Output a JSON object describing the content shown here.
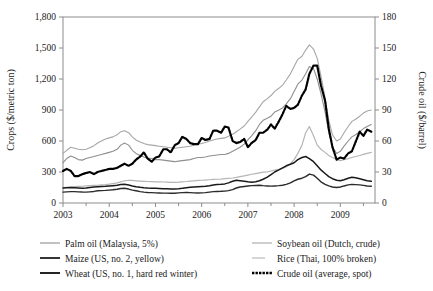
{
  "chart_data": {
    "type": "line",
    "title": "",
    "xlabel": "",
    "ylabel": "Crops ($/metric ton)",
    "y2label": "Crude oil ($/barrel)",
    "xlim": [
      2003.0,
      2009.75
    ],
    "ylim": [
      0,
      1800
    ],
    "y2lim": [
      0,
      180
    ],
    "grid": false,
    "legend_position": "bottom",
    "x_ticks": [
      2003,
      2004,
      2005,
      2006,
      2007,
      2008,
      2009
    ],
    "x_tick_labels": [
      "2003",
      "2004",
      "2005",
      "2006",
      "2007",
      "2008",
      "2009"
    ],
    "x_minor_ticks": [
      2003.5,
      2004.5,
      2005.5,
      2006.5,
      2007.5,
      2008.5,
      2009.5
    ],
    "y_ticks": [
      0,
      300,
      600,
      900,
      1200,
      1500,
      1800
    ],
    "y_tick_labels": [
      "0",
      "300",
      "600",
      "900",
      "1,200",
      "1,500",
      "1,800"
    ],
    "y2_ticks": [
      0,
      30,
      60,
      90,
      120,
      150,
      180
    ],
    "y2_tick_labels": [
      "0",
      "30",
      "60",
      "90",
      "120",
      "150",
      "180"
    ],
    "x": [
      2003.0,
      2003.08,
      2003.17,
      2003.25,
      2003.33,
      2003.42,
      2003.5,
      2003.58,
      2003.67,
      2003.75,
      2003.83,
      2003.92,
      2004.0,
      2004.08,
      2004.17,
      2004.25,
      2004.33,
      2004.42,
      2004.5,
      2004.58,
      2004.67,
      2004.75,
      2004.83,
      2004.92,
      2005.0,
      2005.08,
      2005.17,
      2005.25,
      2005.33,
      2005.42,
      2005.5,
      2005.58,
      2005.67,
      2005.75,
      2005.83,
      2005.92,
      2006.0,
      2006.08,
      2006.17,
      2006.25,
      2006.33,
      2006.42,
      2006.5,
      2006.58,
      2006.67,
      2006.75,
      2006.83,
      2006.92,
      2007.0,
      2007.08,
      2007.17,
      2007.25,
      2007.33,
      2007.42,
      2007.5,
      2007.58,
      2007.67,
      2007.75,
      2007.83,
      2007.92,
      2008.0,
      2008.08,
      2008.17,
      2008.25,
      2008.33,
      2008.42,
      2008.5,
      2008.58,
      2008.67,
      2008.75,
      2008.83,
      2008.92,
      2009.0,
      2009.08,
      2009.17,
      2009.25,
      2009.33,
      2009.42,
      2009.5,
      2009.58,
      2009.67
    ],
    "series": [
      {
        "name": "Palm oil (Malaysia, 5%)",
        "axis": "left",
        "unit": "$/metric ton",
        "color": "#8f8f8f",
        "width": 1.1,
        "dash": "none",
        "values": [
          390,
          430,
          455,
          440,
          420,
          415,
          430,
          440,
          450,
          460,
          470,
          480,
          490,
          500,
          520,
          560,
          580,
          560,
          510,
          480,
          460,
          445,
          435,
          430,
          420,
          420,
          415,
          410,
          405,
          400,
          405,
          410,
          415,
          420,
          430,
          440,
          440,
          445,
          455,
          460,
          465,
          470,
          470,
          480,
          500,
          520,
          540,
          570,
          610,
          650,
          700,
          760,
          800,
          820,
          840,
          880,
          900,
          920,
          960,
          1010,
          1080,
          1150,
          1190,
          1250,
          1320,
          1300,
          1200,
          1060,
          880,
          680,
          540,
          480,
          500,
          550,
          600,
          640,
          660,
          690,
          720,
          740,
          760
        ]
      },
      {
        "name": "Soybean oil (Dutch, crude)",
        "axis": "left",
        "unit": "$/metric ton",
        "color": "#a6a6a6",
        "width": 1.1,
        "dash": "none",
        "values": [
          480,
          510,
          540,
          530,
          520,
          515,
          520,
          535,
          555,
          580,
          600,
          620,
          630,
          640,
          660,
          690,
          700,
          680,
          640,
          610,
          590,
          575,
          565,
          560,
          555,
          550,
          545,
          540,
          535,
          530,
          535,
          540,
          545,
          550,
          560,
          570,
          575,
          585,
          600,
          610,
          620,
          625,
          630,
          645,
          665,
          690,
          715,
          745,
          790,
          830,
          880,
          930,
          980,
          1010,
          1040,
          1080,
          1110,
          1140,
          1190,
          1250,
          1320,
          1390,
          1420,
          1480,
          1530,
          1490,
          1400,
          1230,
          1020,
          800,
          660,
          600,
          620,
          680,
          740,
          790,
          810,
          840,
          870,
          890,
          900
        ]
      },
      {
        "name": "Maize (US, no. 2, yellow)",
        "axis": "left",
        "unit": "$/metric ton",
        "color": "#2b2b2b",
        "width": 1.4,
        "dash": "none",
        "values": [
          105,
          108,
          110,
          110,
          108,
          106,
          105,
          108,
          112,
          118,
          120,
          122,
          125,
          128,
          133,
          140,
          143,
          135,
          125,
          118,
          110,
          105,
          102,
          100,
          98,
          97,
          96,
          96,
          95,
          95,
          98,
          100,
          102,
          100,
          98,
          97,
          98,
          100,
          105,
          110,
          112,
          113,
          115,
          120,
          130,
          145,
          155,
          160,
          165,
          168,
          170,
          172,
          168,
          165,
          163,
          165,
          168,
          172,
          180,
          195,
          215,
          230,
          240,
          255,
          280,
          270,
          240,
          205,
          180,
          165,
          155,
          150,
          155,
          165,
          175,
          180,
          178,
          175,
          170,
          165,
          162
        ]
      },
      {
        "name": "Rice (Thai, 100% broken)",
        "axis": "left",
        "unit": "$/metric ton",
        "color": "#b5b5b5",
        "width": 1.2,
        "dash": "none",
        "values": [
          150,
          152,
          155,
          158,
          160,
          162,
          165,
          168,
          170,
          172,
          175,
          178,
          182,
          188,
          195,
          205,
          215,
          220,
          218,
          215,
          212,
          210,
          208,
          206,
          205,
          204,
          203,
          202,
          200,
          200,
          202,
          205,
          208,
          212,
          215,
          218,
          220,
          222,
          225,
          228,
          230,
          232,
          235,
          238,
          242,
          248,
          255,
          262,
          270,
          278,
          285,
          292,
          298,
          302,
          310,
          318,
          325,
          335,
          350,
          380,
          420,
          480,
          560,
          680,
          740,
          650,
          560,
          520,
          490,
          460,
          440,
          420,
          410,
          420,
          430,
          440,
          450,
          460,
          470,
          480,
          490
        ]
      },
      {
        "name": "Wheat (US, no. 1, hard red winter)",
        "axis": "left",
        "unit": "$/metric ton",
        "color": "#1a1a1a",
        "width": 1.5,
        "dash": "none",
        "values": [
          145,
          148,
          150,
          148,
          145,
          142,
          145,
          150,
          155,
          158,
          160,
          162,
          165,
          168,
          172,
          178,
          182,
          175,
          165,
          158,
          152,
          148,
          145,
          143,
          142,
          140,
          138,
          137,
          136,
          135,
          138,
          142,
          148,
          152,
          155,
          158,
          160,
          162,
          168,
          175,
          180,
          182,
          185,
          195,
          210,
          220,
          215,
          210,
          205,
          202,
          205,
          215,
          230,
          250,
          275,
          300,
          320,
          340,
          360,
          375,
          390,
          420,
          440,
          450,
          430,
          400,
          360,
          320,
          285,
          255,
          235,
          220,
          215,
          225,
          240,
          250,
          245,
          235,
          225,
          215,
          210
        ]
      },
      {
        "name": "Crude oil (average, spot)",
        "axis": "right",
        "unit": "$/barrel",
        "color": "#000000",
        "width": 2.2,
        "dash": "dotted-thick",
        "values": [
          31,
          33,
          31,
          26,
          26,
          28,
          29,
          30,
          28,
          30,
          31,
          32,
          33,
          33,
          34,
          36,
          38,
          36,
          38,
          42,
          45,
          49,
          43,
          40,
          44,
          45,
          52,
          52,
          49,
          56,
          58,
          64,
          62,
          58,
          57,
          57,
          63,
          61,
          62,
          70,
          70,
          68,
          74,
          73,
          60,
          58,
          59,
          62,
          54,
          58,
          61,
          68,
          68,
          71,
          76,
          72,
          79,
          86,
          94,
          91,
          92,
          95,
          104,
          110,
          125,
          133,
          133,
          114,
          99,
          72,
          54,
          42,
          44,
          43,
          48,
          50,
          59,
          69,
          65,
          71,
          69
        ]
      }
    ],
    "legend": [
      {
        "label": "Palm oil (Malaysia, 5%)",
        "color": "#8f8f8f",
        "style": "thin"
      },
      {
        "label": "Soybean oil (Dutch, crude)",
        "color": "#a6a6a6",
        "style": "thin"
      },
      {
        "label": "Maize (US, no. 2, yellow)",
        "color": "#2b2b2b",
        "style": "medium"
      },
      {
        "label": "Rice (Thai, 100% broken)",
        "color": "#b5b5b5",
        "style": "thin"
      },
      {
        "label": "Wheat (US, no. 1, hard red winter)",
        "color": "#1a1a1a",
        "style": "medium"
      },
      {
        "label": "Crude oil (average, spot)",
        "color": "#000000",
        "style": "thick-dotted"
      }
    ]
  }
}
